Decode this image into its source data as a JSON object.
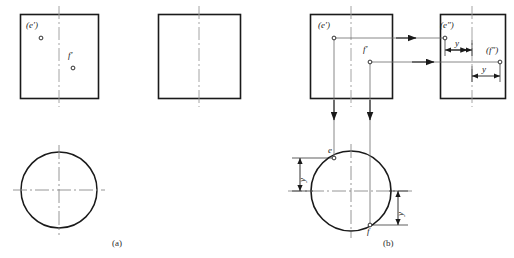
{
  "figure": {
    "title_fragment": "",
    "captions": [
      {
        "id": "caption-a",
        "text": "(a)",
        "x": 112,
        "y": 239
      },
      {
        "id": "caption-b",
        "text": "(b)",
        "x": 383,
        "y": 239
      }
    ]
  },
  "panel_a": {
    "name": "panel-a",
    "front_view": {
      "name": "front-view-rect-a",
      "x": 20,
      "y": 14,
      "w": 78,
      "h": 84,
      "centerline_x": 59
    },
    "side_view": {
      "name": "side-view-rect-a",
      "x": 158,
      "y": 14,
      "w": 82,
      "h": 84,
      "centerline_x": 199
    },
    "top_view": {
      "name": "top-view-circle-a",
      "cx": 59,
      "cy": 190,
      "r": 38
    },
    "points": [
      {
        "id": "point-e-prime-a",
        "label": "(e′)",
        "px": 41,
        "py": 38,
        "lx": 27,
        "ly": 26
      },
      {
        "id": "point-f-prime-a",
        "label": "f′",
        "px": 73,
        "py": 68,
        "lx": 68,
        "ly": 55
      }
    ]
  },
  "panel_b": {
    "name": "panel-b",
    "front_view": {
      "name": "front-view-rect-b",
      "x": 310,
      "y": 14,
      "w": 82,
      "h": 84,
      "centerline_x": 351
    },
    "side_view": {
      "name": "side-view-rect-b",
      "x": 440,
      "y": 14,
      "w": 65,
      "h": 84,
      "centerline_x": 472
    },
    "top_view": {
      "name": "top-view-circle-b",
      "cx": 351,
      "cy": 191,
      "r": 40
    },
    "points": [
      {
        "id": "point-e-prime-b",
        "label": "(e′)",
        "px": 334,
        "py": 38,
        "lx": 320,
        "ly": 26
      },
      {
        "id": "point-f-prime-b",
        "label": "f′",
        "px": 370,
        "py": 62,
        "lx": 364,
        "ly": 49
      },
      {
        "id": "point-e-dprime-b",
        "label": "(e″)",
        "px": 445,
        "py": 38,
        "lx": 440,
        "ly": 26
      },
      {
        "id": "point-f-dprime-b",
        "label": "(f″)",
        "px": 500,
        "py": 62,
        "lx": 487,
        "ly": 50
      },
      {
        "id": "point-e-top-b",
        "label": "e",
        "px": 334,
        "py": 158,
        "lx": 329,
        "ly": 148
      },
      {
        "id": "point-f-top-b",
        "label": "f",
        "px": 370,
        "py": 225,
        "lx": 366,
        "ly": 228
      }
    ],
    "dimensions": [
      {
        "id": "dim-y-side-e",
        "label": "y",
        "orientation": "horizontal",
        "x1": 445,
        "x2": 472,
        "y": 50,
        "lx": 454,
        "ly": 39
      },
      {
        "id": "dim-y-side-f",
        "label": "y",
        "orientation": "horizontal",
        "x1": 472,
        "x2": 500,
        "y": 76,
        "lx": 481,
        "ly": 65
      },
      {
        "id": "dim-y-top-e",
        "label": "y",
        "orientation": "vertical",
        "x": 300,
        "y1": 158,
        "y2": 191,
        "lx": 297,
        "ly": 182
      },
      {
        "id": "dim-y-top-f",
        "label": "y",
        "orientation": "vertical",
        "x": 398,
        "y1": 191,
        "y2": 225,
        "lx": 395,
        "ly": 216
      }
    ],
    "projection_arrows": [
      {
        "id": "arrow-e-to-side",
        "from_x": 334,
        "from_y": 38,
        "to_x": 445,
        "to_y": 38,
        "dir": "right"
      },
      {
        "id": "arrow-f-to-side",
        "from_x": 370,
        "from_y": 62,
        "to_x": 500,
        "to_y": 62,
        "dir": "right"
      },
      {
        "id": "arrow-e-to-top",
        "from_x": 334,
        "from_y": 38,
        "to_x": 334,
        "to_y": 158,
        "dir": "down"
      },
      {
        "id": "arrow-f-to-top",
        "from_x": 370,
        "from_y": 62,
        "to_x": 370,
        "to_y": 225,
        "dir": "down"
      }
    ]
  },
  "style": {
    "outline_color": "#1a1a1a",
    "thin_color": "#555555",
    "center_color": "#8a8a8a",
    "point_color": "#1a1a1a"
  }
}
